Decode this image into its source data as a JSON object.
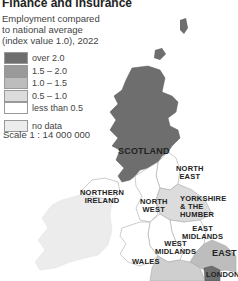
{
  "title": "Finance and insurance",
  "subtitle": [
    "Employment compared",
    "to national average",
    "(index value 1.0), 2022"
  ],
  "legend": [
    {
      "label": "over 2.0",
      "color": "#6e6e6e"
    },
    {
      "label": "1.5 – 2.0",
      "color": "#9a9a9a"
    },
    {
      "label": "1.0 – 1.5",
      "color": "#bdbdbd"
    },
    {
      "label": "0.5 – 1.0",
      "color": "#dcdcdc"
    },
    {
      "label": "less than 0.5",
      "color": "#ffffff"
    }
  ],
  "no_data": {
    "label": "no data",
    "color": "#ececec"
  },
  "scale": "Scale 1 : 14 000 000",
  "regions": {
    "scotland": {
      "label": "SCOTLAND",
      "class": "over 2.0"
    },
    "northern_ireland": {
      "label": "NORTHERN\nIRELAND",
      "class": "less than 0.5"
    },
    "north_east": {
      "label": "NORTH\nEAST",
      "class": "less than 0.5"
    },
    "north_west": {
      "label": "NORTH\nWEST",
      "class": "less than 0.5"
    },
    "yorkshire": {
      "label": "YORKSHIRE\n& THE HUMBER",
      "class": "0.5 – 1.0"
    },
    "east_midlands": {
      "label": "EAST\nMIDLANDS",
      "class": "less than 0.5"
    },
    "west_midlands": {
      "label": "WEST\nMIDLANDS",
      "class": "less than 0.5"
    },
    "wales": {
      "label": "WALES",
      "class": "less than 0.5"
    },
    "east": {
      "label": "EAST",
      "class": "1.0 – 1.5"
    },
    "london": {
      "label": "LONDON",
      "class": "over 2.0"
    },
    "ireland": {
      "class": "no data"
    }
  }
}
